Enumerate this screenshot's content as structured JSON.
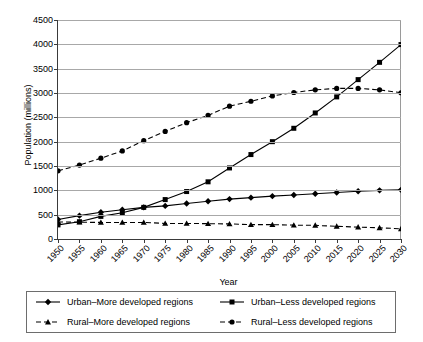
{
  "chart_data": {
    "type": "line",
    "title": "",
    "xlabel": "Year",
    "ylabel": "Population (millions)",
    "xlim": [
      1950,
      2030
    ],
    "ylim": [
      0,
      4500
    ],
    "ytick_step": 500,
    "grid": true,
    "legend_position": "bottom",
    "x": [
      1950,
      1955,
      1960,
      1965,
      1970,
      1975,
      1980,
      1985,
      1990,
      1995,
      2000,
      2005,
      2010,
      2015,
      2020,
      2025,
      2030
    ],
    "categories": [
      "1950",
      "1955",
      "1960",
      "1965",
      "1970",
      "1975",
      "1980",
      "1985",
      "1990",
      "1995",
      "2000",
      "2005",
      "2010",
      "2015",
      "2020",
      "2025",
      "2030"
    ],
    "ytick_labels": [
      "0",
      "500",
      "1000",
      "1500",
      "2000",
      "2500",
      "3000",
      "3500",
      "4000",
      "4500"
    ],
    "ytick_values": [
      0,
      500,
      1000,
      1500,
      2000,
      2500,
      3000,
      3500,
      4000,
      4500
    ],
    "series": [
      {
        "name": "Urban–More developed regions",
        "marker": "diamond",
        "line": "solid",
        "color": "#000000",
        "values": [
          400,
          480,
          550,
          600,
          650,
          680,
          730,
          775,
          820,
          850,
          880,
          905,
          930,
          955,
          980,
          1000,
          1010
        ]
      },
      {
        "name": "Urban–Less developed regions",
        "marker": "square",
        "line": "solid",
        "color": "#000000",
        "values": [
          290,
          355,
          465,
          540,
          650,
          810,
          975,
          1175,
          1460,
          1735,
          2000,
          2275,
          2590,
          2920,
          3275,
          3630,
          3995
        ]
      },
      {
        "name": "Rural–More developed regions",
        "marker": "triangle",
        "line": "dashed",
        "color": "#000000",
        "values": [
          350,
          345,
          340,
          340,
          340,
          320,
          320,
          315,
          310,
          295,
          295,
          285,
          280,
          260,
          245,
          230,
          210
        ]
      },
      {
        "name": "Rural–Less developed regions",
        "marker": "circle",
        "line": "dashed",
        "color": "#000000",
        "values": [
          1400,
          1520,
          1660,
          1810,
          2020,
          2210,
          2390,
          2540,
          2730,
          2830,
          2940,
          3010,
          3065,
          3095,
          3095,
          3065,
          3005
        ]
      }
    ]
  },
  "legend": {
    "items": [
      {
        "label": "Urban–More developed regions"
      },
      {
        "label": "Urban–Less developed regions"
      },
      {
        "label": "Rural–More developed regions"
      },
      {
        "label": "Rural–Less developed regions"
      }
    ]
  }
}
